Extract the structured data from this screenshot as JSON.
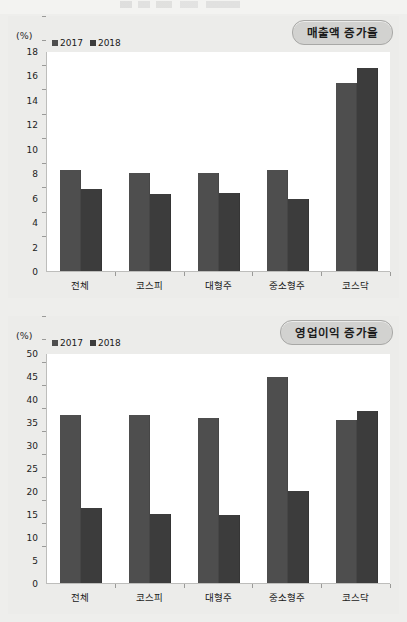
{
  "page": {
    "background": "#eeeeec"
  },
  "charts": [
    {
      "id": "sales",
      "badge_label": "매출액 증가율",
      "unit_label": "(%)",
      "legend": [
        {
          "label": "2017",
          "color": "#4e4e4e"
        },
        {
          "label": "2018",
          "color": "#3c3c3c"
        }
      ],
      "chart_data": {
        "type": "bar",
        "title": "매출액 증가율",
        "xlabel": "",
        "ylabel": "(%)",
        "ylim": [
          0,
          18
        ],
        "ytick_step": 2,
        "yticks": [
          0,
          2,
          4,
          6,
          8,
          10,
          12,
          14,
          16,
          18
        ],
        "grid": false,
        "legend_position": "top-left",
        "categories": [
          "전체",
          "코스피",
          "대형주",
          "중소형주",
          "코스닥"
        ],
        "series": [
          {
            "name": "2017",
            "color": "#4e4e4e",
            "values": [
              8.3,
              8.0,
              8.0,
              8.3,
              15.4
            ]
          },
          {
            "name": "2018",
            "color": "#3c3c3c",
            "values": [
              6.7,
              6.3,
              6.4,
              5.9,
              16.6
            ]
          }
        ]
      }
    },
    {
      "id": "profit",
      "badge_label": "영업이익 증가율",
      "unit_label": "(%)",
      "legend": [
        {
          "label": "2017",
          "color": "#4e4e4e"
        },
        {
          "label": "2018",
          "color": "#3c3c3c"
        }
      ],
      "chart_data": {
        "type": "bar",
        "title": "영업이익 증가율",
        "xlabel": "",
        "ylabel": "(%)",
        "ylim": [
          0,
          50
        ],
        "ytick_step": 5,
        "yticks": [
          0,
          5,
          10,
          15,
          20,
          25,
          30,
          35,
          40,
          45,
          50
        ],
        "grid": false,
        "legend_position": "top-left",
        "categories": [
          "전체",
          "코스피",
          "대형주",
          "중소형주",
          "코스닥"
        ],
        "series": [
          {
            "name": "2017",
            "color": "#4e4e4e",
            "values": [
              36.5,
              36.6,
              35.8,
              44.8,
              35.4
            ]
          },
          {
            "name": "2018",
            "color": "#3c3c3c",
            "values": [
              16.2,
              15.0,
              14.7,
              20.1,
              37.4
            ]
          }
        ]
      }
    }
  ]
}
